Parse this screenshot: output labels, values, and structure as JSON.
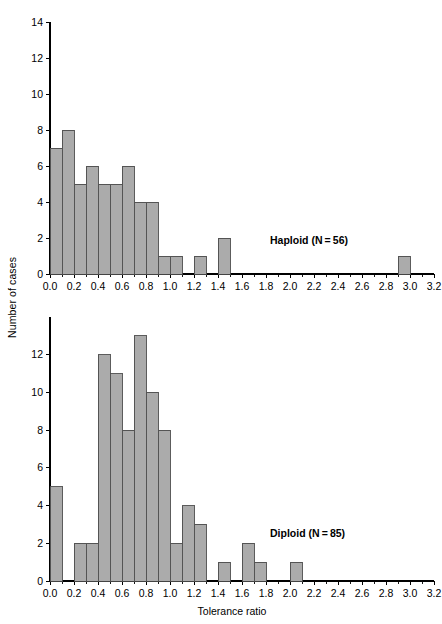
{
  "figure": {
    "ylabel": "Number of cases",
    "xlabel": "Tolerance ratio",
    "bar_fill": "#ababab",
    "bar_stroke": "#4a4a4a",
    "axis_color": "#000000"
  },
  "chart_data": [
    {
      "type": "bar",
      "subtype": "histogram",
      "panel": "top",
      "title": "",
      "series_label": "Haploid (N = 56)",
      "sample_size": 56,
      "xlabel": "",
      "ylabel": "Number of cases",
      "xlim": [
        0.0,
        3.2
      ],
      "ylim": [
        0,
        14
      ],
      "bin_width": 0.1,
      "grid": false,
      "legend_position": "inside-right",
      "xticks": [
        0.0,
        0.2,
        0.4,
        0.6,
        0.8,
        1.0,
        1.2,
        1.4,
        1.6,
        1.8,
        2.0,
        2.2,
        2.4,
        2.6,
        2.8,
        3.0,
        3.2
      ],
      "xticklabels": [
        "0.0",
        "0.2",
        "0.4",
        "0.6",
        "0.8",
        "1.0",
        "1.2",
        "1.4",
        "1.6",
        "1.8",
        "2.0",
        "2.2",
        "2.4",
        "2.6",
        "2.8",
        "3.0",
        "3.2"
      ],
      "yticks": [
        0,
        2,
        4,
        6,
        8,
        10,
        12,
        14
      ],
      "yticklabels": [
        "0",
        "2",
        "4",
        "6",
        "8",
        "10",
        "12",
        "14"
      ],
      "bin_starts": [
        0.0,
        0.1,
        0.2,
        0.3,
        0.4,
        0.5,
        0.6,
        0.7,
        0.8,
        0.9,
        1.0,
        1.1,
        1.2,
        1.3,
        1.4,
        1.5,
        1.6,
        1.7,
        1.8,
        1.9,
        2.0,
        2.1,
        2.2,
        2.3,
        2.4,
        2.5,
        2.6,
        2.7,
        2.8,
        2.9,
        3.0,
        3.1
      ],
      "values": [
        7,
        8,
        5,
        6,
        5,
        5,
        6,
        4,
        4,
        1,
        1,
        0,
        1,
        0,
        2,
        0,
        0,
        0,
        0,
        0,
        0,
        0,
        0,
        0,
        0,
        0,
        0,
        0,
        0,
        1,
        0,
        0
      ]
    },
    {
      "type": "bar",
      "subtype": "histogram",
      "panel": "bottom",
      "title": "",
      "series_label": "Diploid (N = 85)",
      "sample_size": 85,
      "xlabel": "Tolerance ratio",
      "ylabel": "Number of cases",
      "xlim": [
        0.0,
        3.2
      ],
      "ylim": [
        0,
        14
      ],
      "bin_width": 0.1,
      "grid": false,
      "legend_position": "inside-right",
      "xticks": [
        0.0,
        0.2,
        0.4,
        0.6,
        0.8,
        1.0,
        1.2,
        1.4,
        1.6,
        1.8,
        2.0,
        2.2,
        2.4,
        2.6,
        2.8,
        3.0,
        3.2
      ],
      "xticklabels": [
        "0.0",
        "0.2",
        "0.4",
        "0.6",
        "0.8",
        "1.0",
        "1.2",
        "1.4",
        "1.6",
        "1.8",
        "2.0",
        "2.2",
        "2.4",
        "2.6",
        "2.8",
        "3.0",
        "3.2"
      ],
      "yticks": [
        0,
        2,
        4,
        6,
        8,
        10,
        12
      ],
      "yticklabels": [
        "0",
        "2",
        "4",
        "6",
        "8",
        "10",
        "12"
      ],
      "bin_starts": [
        0.0,
        0.1,
        0.2,
        0.3,
        0.4,
        0.5,
        0.6,
        0.7,
        0.8,
        0.9,
        1.0,
        1.1,
        1.2,
        1.3,
        1.4,
        1.5,
        1.6,
        1.7,
        1.8,
        1.9,
        2.0,
        2.1,
        2.2,
        2.3,
        2.4,
        2.5,
        2.6,
        2.7,
        2.8,
        2.9,
        3.0,
        3.1
      ],
      "values": [
        5,
        0,
        2,
        2,
        12,
        11,
        8,
        13,
        10,
        8,
        2,
        4,
        3,
        0,
        1,
        0,
        2,
        1,
        0,
        0,
        1,
        0,
        0,
        0,
        0,
        0,
        0,
        0,
        0,
        0,
        0,
        0
      ]
    }
  ]
}
